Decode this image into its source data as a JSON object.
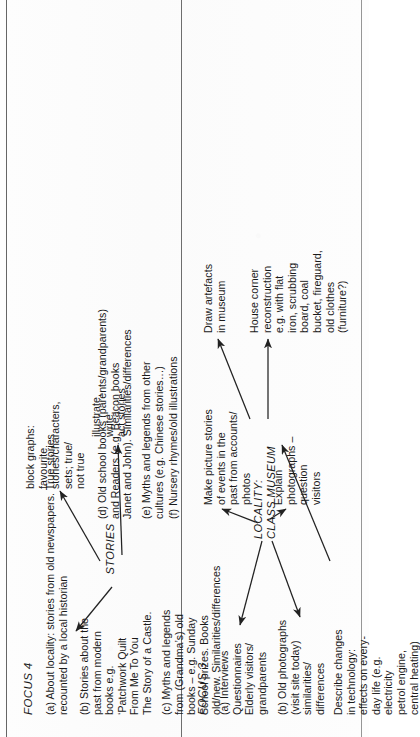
{
  "document": {
    "type": "scanned-diagram",
    "orientation": "rotated-90-ccw",
    "ink_color": "#1a1a1a",
    "paper_color": "#fdfdfd"
  },
  "sections": {
    "focus3": {
      "label": "FOCUS 3",
      "items": [
        {
          "id": "a",
          "text": "(a) Interviews\nQuestionnaires\nElderly visitors/\ngrandparents"
        },
        {
          "id": "b",
          "text": "(b) Old photographs\n(visit site today)\nsimilarities/\ndifferences"
        },
        {
          "id": "c",
          "text": "Describe changes\nin technology:\neffects on every-\nday life (e.g.\nelectricity\npetrol engine,\ncentral heating)"
        }
      ],
      "outcomes": [
        {
          "id": "make-picture-stories",
          "text": "Make picture stories\nof events in the\npast from accounts/\nphotos"
        },
        {
          "id": "explain-photographs",
          "text": "Explain\nphotographs –\nquestion\nvisitors"
        },
        {
          "id": "draw-artefacts",
          "text": "Draw artefacts\nin museum"
        },
        {
          "id": "house-corner",
          "text": "House corner\nreconstruction\ne.g. with flat\niron, scrubbing\nboard, coal\nbucket, fireguard,\nold clothes\n(furniture?)"
        }
      ],
      "center": "LOCALITY:\nCLASS MUSEUM"
    },
    "focus4": {
      "label": "FOCUS 4",
      "items": [
        {
          "id": "a",
          "text": "(a) About locality: stories from old newspapers. True stories\nrecounted by a local historian"
        },
        {
          "id": "b",
          "text": "(b) Stories about the\npast from modern\nbooks e.g.\n‘Patchwork Quilt\nFrom Me To You\nThe Story of a Castle."
        },
        {
          "id": "c",
          "text": "(c) Myths and legends\nfrom (Grandma’s) old\nbooks – e.g. Sunday\nSchool prizes. Books\nold/new. Similarities/differences"
        },
        {
          "id": "d",
          "text": "(d) Old school books (parents/grandparents)\nand Readers (e.g. Beacon books\nJanet and John). Similarities/differences"
        },
        {
          "id": "e",
          "text": "(e) Myths and legends from other\ncultures (e.g. Chinese stories…)"
        },
        {
          "id": "f",
          "text": "(f) Nursery rhymes/old illustrations"
        }
      ],
      "outcomes": [
        {
          "id": "block-graphs",
          "text": "block graphs:\nfavourite\nstories/characters,\nsets; true/\nnot true"
        },
        {
          "id": "illustrate-write-act",
          "text": "illustrate,\nwrite,\nact stories"
        }
      ],
      "center": "STORIES"
    }
  }
}
